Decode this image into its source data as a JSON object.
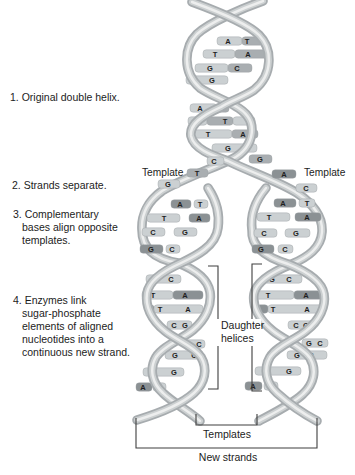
{
  "colors": {
    "background": "#ffffff",
    "bar_light": "#cbd0d2",
    "bar_medium": "#a9aeb1",
    "bar_dark": "#8b9194",
    "bar_stroke": "#9aa0a2",
    "letter": "#1e1e1e",
    "ribbon_edge": "#a7acaf",
    "ribbon_mid": "#ccd0d1",
    "ribbon_highlight": "#edeeee",
    "bracket": "#3f3f3f",
    "text": "#1c1c1c"
  },
  "steps": [
    {
      "lines": [
        "1. Original double helix."
      ]
    },
    {
      "lines": [
        "2. Strands separate."
      ]
    },
    {
      "lines": [
        "3. Complementary",
        "bases align opposite",
        "templates."
      ]
    },
    {
      "lines": [
        "4. Enzymes link",
        "sugar-phosphate",
        "elements of aligned",
        "nucleotides into a",
        "continuous new strand."
      ]
    }
  ],
  "labels": {
    "template_left": "Template",
    "template_right": "Template",
    "daughter_line1": "Daughter",
    "daughter_line2": "helices",
    "templates": "Templates",
    "new_strands": "New strands"
  },
  "rungs": [
    {
      "y": 41,
      "layer": "under",
      "segs": [
        [
          217,
          25,
          "l"
        ],
        [
          242,
          21,
          "m"
        ]
      ],
      "letters": [
        [
          "A",
          228
        ],
        [
          "T",
          247
        ]
      ]
    },
    {
      "y": 54,
      "layer": "under",
      "segs": [
        [
          203,
          32,
          "l"
        ],
        [
          235,
          33,
          "m"
        ]
      ],
      "letters": [
        [
          "T",
          215
        ],
        [
          "A",
          248
        ]
      ]
    },
    {
      "y": 68,
      "layer": "under",
      "segs": [
        [
          195,
          33,
          "l"
        ],
        [
          228,
          24,
          "m"
        ]
      ],
      "letters": [
        [
          "G",
          210
        ],
        [
          "C",
          237
        ]
      ]
    },
    {
      "y": 80,
      "layer": "under",
      "segs": [
        [
          186,
          42,
          "l"
        ]
      ],
      "letters": [
        [
          "C",
          194
        ],
        [
          "G",
          212
        ]
      ]
    },
    {
      "y": 108,
      "layer": "under",
      "segs": [
        [
          190,
          27,
          "l"
        ],
        [
          217,
          12,
          "m"
        ]
      ],
      "letters": [
        [
          "A",
          200
        ],
        [
          "T",
          222
        ]
      ]
    },
    {
      "y": 121,
      "layer": "under",
      "segs": [
        [
          188,
          19,
          "l"
        ],
        [
          207,
          26,
          "m"
        ],
        [
          233,
          22,
          "l"
        ]
      ],
      "letters": [
        [
          "A",
          198
        ],
        [
          "T",
          225
        ]
      ]
    },
    {
      "y": 134,
      "layer": "under",
      "segs": [
        [
          192,
          40,
          "l"
        ],
        [
          232,
          26,
          "m"
        ]
      ],
      "letters": [
        [
          "T",
          208
        ],
        [
          "A",
          243
        ]
      ]
    },
    {
      "y": 148,
      "layer": "under",
      "segs": [
        [
          212,
          45,
          "l"
        ]
      ],
      "letters": [
        [
          "G",
          228
        ],
        [
          "C",
          243
        ]
      ]
    },
    {
      "y": 161,
      "layer": "over",
      "segs": [
        [
          207,
          17,
          "l"
        ]
      ],
      "letters": [
        [
          "C",
          214
        ]
      ]
    },
    {
      "y": 159,
      "layer": "over",
      "segs": [
        [
          249,
          23,
          "m"
        ]
      ],
      "letters": [
        [
          "G",
          260
        ]
      ]
    },
    {
      "y": 173,
      "layer": "over",
      "segs": [
        [
          187,
          21,
          "m"
        ]
      ],
      "letters": [
        [
          "T",
          197
        ]
      ]
    },
    {
      "y": 174,
      "layer": "over",
      "segs": [
        [
          272,
          24,
          "d"
        ]
      ],
      "letters": [
        [
          "A",
          284
        ]
      ]
    },
    {
      "y": 184,
      "layer": "over",
      "segs": [
        [
          158,
          22,
          "l"
        ]
      ],
      "letters": [
        [
          "G",
          168
        ]
      ]
    },
    {
      "y": 188,
      "layer": "over",
      "segs": [
        [
          296,
          21,
          "l"
        ]
      ],
      "letters": [
        [
          "C",
          306
        ]
      ]
    },
    {
      "y": 204,
      "layer": "over",
      "segs": [
        [
          171,
          20,
          "d"
        ],
        [
          194,
          14,
          "l"
        ]
      ],
      "letters": [
        [
          "A",
          180
        ],
        [
          "T",
          200
        ]
      ]
    },
    {
      "y": 218,
      "layer": "over",
      "segs": [
        [
          147,
          33,
          "l"
        ],
        [
          189,
          21,
          "d"
        ]
      ],
      "letters": [
        [
          "T",
          164
        ],
        [
          "A",
          199
        ]
      ]
    },
    {
      "y": 232,
      "layer": "over",
      "segs": [
        [
          142,
          23,
          "l"
        ],
        [
          174,
          23,
          "l"
        ]
      ],
      "letters": [
        [
          "C",
          153
        ],
        [
          "G",
          185
        ]
      ]
    },
    {
      "y": 249,
      "layer": "over",
      "segs": [
        [
          140,
          23,
          "d"
        ],
        [
          166,
          14,
          "l"
        ]
      ],
      "letters": [
        [
          "G",
          151
        ],
        [
          "C",
          172
        ]
      ]
    },
    {
      "y": 279,
      "layer": "under",
      "segs": [
        [
          146,
          35,
          "l"
        ]
      ],
      "letters": [
        [
          "G",
          156
        ],
        [
          "C",
          171
        ]
      ]
    },
    {
      "y": 295,
      "layer": "under",
      "segs": [
        [
          142,
          31,
          "l"
        ],
        [
          173,
          30,
          "d"
        ]
      ],
      "letters": [
        [
          "T",
          153
        ],
        [
          "A",
          185
        ]
      ]
    },
    {
      "y": 309,
      "layer": "under",
      "segs": [
        [
          146,
          8,
          "d"
        ],
        [
          154,
          49,
          "l"
        ]
      ],
      "letters": [
        [
          "T",
          160
        ],
        [
          "A",
          188
        ]
      ]
    },
    {
      "y": 325,
      "layer": "under",
      "segs": [
        [
          167,
          25,
          "l"
        ]
      ],
      "letters": [
        [
          "C",
          174
        ],
        [
          "G",
          185
        ]
      ]
    },
    {
      "y": 344,
      "layer": "under",
      "segs": [
        [
          183,
          22,
          "l"
        ]
      ],
      "letters": [
        [
          "G",
          189
        ],
        [
          "C",
          199
        ]
      ]
    },
    {
      "y": 355,
      "layer": "under",
      "segs": [
        [
          165,
          38,
          "l"
        ]
      ],
      "letters": [
        [
          "G",
          175
        ],
        [
          "C",
          194
        ]
      ]
    },
    {
      "y": 372,
      "layer": "under",
      "segs": [
        [
          143,
          41,
          "l"
        ]
      ],
      "letters": [
        [
          "C",
          153
        ],
        [
          "G",
          174
        ]
      ]
    },
    {
      "y": 387,
      "layer": "under",
      "segs": [
        [
          136,
          16,
          "d"
        ],
        [
          153,
          13,
          "l"
        ]
      ],
      "letters": [
        [
          "A",
          143
        ],
        [
          "T",
          159
        ]
      ]
    },
    {
      "y": 203,
      "layer": "over",
      "segs": [
        [
          274,
          22,
          "d"
        ],
        [
          299,
          16,
          "l"
        ]
      ],
      "letters": [
        [
          "A",
          283
        ],
        [
          "T",
          307
        ]
      ]
    },
    {
      "y": 217,
      "layer": "over",
      "segs": [
        [
          257,
          33,
          "l"
        ],
        [
          295,
          26,
          "d"
        ]
      ],
      "letters": [
        [
          "T",
          269
        ],
        [
          "A",
          307
        ]
      ]
    },
    {
      "y": 233,
      "layer": "over",
      "segs": [
        [
          254,
          23,
          "l"
        ],
        [
          285,
          25,
          "l"
        ]
      ],
      "letters": [
        [
          "C",
          264
        ],
        [
          "G",
          296
        ]
      ]
    },
    {
      "y": 249,
      "layer": "over",
      "segs": [
        [
          252,
          22,
          "d"
        ],
        [
          278,
          15,
          "l"
        ]
      ],
      "letters": [
        [
          "G",
          261
        ],
        [
          "C",
          285
        ]
      ]
    },
    {
      "y": 279,
      "layer": "under",
      "segs": [
        [
          264,
          38,
          "l"
        ]
      ],
      "letters": [
        [
          "G",
          272
        ],
        [
          "C",
          289
        ]
      ]
    },
    {
      "y": 295,
      "layer": "under",
      "segs": [
        [
          252,
          42,
          "l"
        ],
        [
          294,
          29,
          "d"
        ]
      ],
      "letters": [
        [
          "T",
          268
        ],
        [
          "A",
          306
        ]
      ]
    },
    {
      "y": 309,
      "layer": "under",
      "segs": [
        [
          257,
          11,
          "d"
        ],
        [
          268,
          57,
          "l"
        ]
      ],
      "letters": [
        [
          "T",
          273
        ],
        [
          "A",
          307
        ]
      ]
    },
    {
      "y": 325,
      "layer": "under",
      "segs": [
        [
          288,
          28,
          "l"
        ]
      ],
      "letters": [
        [
          "C",
          296
        ],
        [
          "G",
          306
        ]
      ]
    },
    {
      "y": 343,
      "layer": "under",
      "segs": [
        [
          302,
          26,
          "l"
        ]
      ],
      "letters": [
        [
          "G",
          309
        ],
        [
          "C",
          320
        ]
      ]
    },
    {
      "y": 355,
      "layer": "under",
      "segs": [
        [
          287,
          40,
          "l"
        ]
      ],
      "letters": [
        [
          "G",
          297
        ],
        [
          "C",
          311
        ]
      ]
    },
    {
      "y": 371,
      "layer": "under",
      "segs": [
        [
          255,
          46,
          "l"
        ]
      ],
      "letters": [
        [
          "C",
          266
        ],
        [
          "G",
          289
        ]
      ]
    },
    {
      "y": 386,
      "layer": "under",
      "segs": [
        [
          245,
          17,
          "d"
        ],
        [
          264,
          14,
          "l"
        ]
      ],
      "letters": [
        [
          "A",
          253
        ],
        [
          "T",
          270
        ]
      ]
    }
  ]
}
